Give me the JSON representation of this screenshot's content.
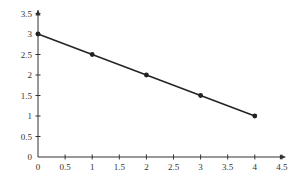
{
  "chart_data": {
    "type": "line",
    "title": "",
    "xlabel": "",
    "ylabel": "",
    "xlim": [
      0,
      4.5
    ],
    "ylim": [
      0,
      3.5
    ],
    "grid": false,
    "legend": null,
    "x_ticks": [
      "0",
      "0.5",
      "1",
      "1.5",
      "2",
      "2.5",
      "3",
      "3.5",
      "4",
      "4.5"
    ],
    "y_ticks": [
      "0",
      "0.5",
      "1",
      "1.5",
      "2",
      "2.5",
      "3",
      "3.5"
    ],
    "series": [
      {
        "name": "line",
        "color": "#222222",
        "marker": "circle",
        "x": [
          0,
          1,
          2,
          3,
          4
        ],
        "y": [
          3,
          2.5,
          2,
          1.5,
          1
        ]
      }
    ]
  },
  "colors": {
    "axis": "#333333",
    "line": "#222222",
    "background": "#ffffff"
  }
}
